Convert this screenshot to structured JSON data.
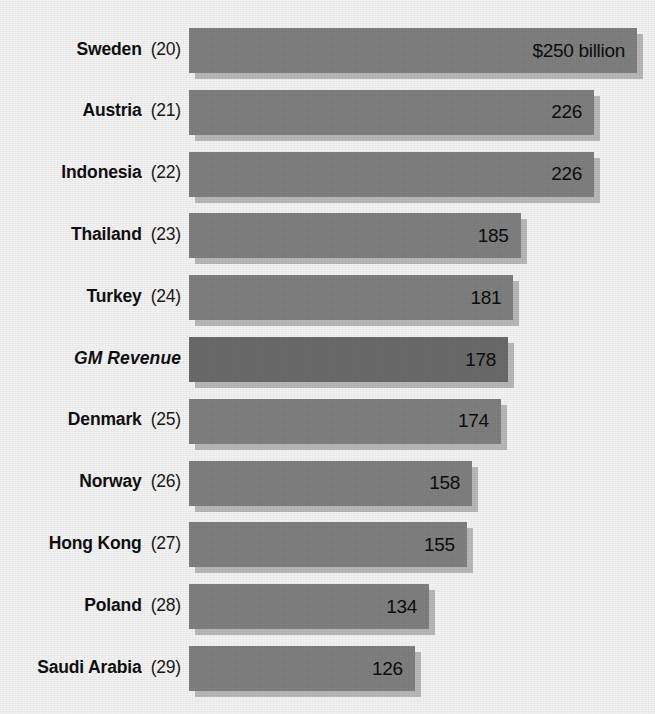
{
  "chart_data": {
    "type": "bar",
    "orientation": "horizontal",
    "title": "",
    "xlabel": "",
    "ylabel": "",
    "unit": "$ billion",
    "xlim": [
      0,
      250
    ],
    "grid": false,
    "legend": false,
    "value_label_position": "inside-end",
    "categories": [
      "Sweden",
      "Austria",
      "Indonesia",
      "Thailand",
      "Turkey",
      "GM Revenue",
      "Denmark",
      "Norway",
      "Hong Kong",
      "Poland",
      "Saudi Arabia"
    ],
    "values": [
      250,
      226,
      226,
      185,
      181,
      178,
      174,
      158,
      155,
      134,
      126
    ],
    "rows": [
      {
        "name": "Sweden",
        "rank": "(20)",
        "value": 250,
        "value_label": "$250 billion",
        "highlight": false,
        "italic": false
      },
      {
        "name": "Austria",
        "rank": "(21)",
        "value": 226,
        "value_label": "226",
        "highlight": false,
        "italic": false
      },
      {
        "name": "Indonesia",
        "rank": "(22)",
        "value": 226,
        "value_label": "226",
        "highlight": false,
        "italic": false
      },
      {
        "name": "Thailand",
        "rank": "(23)",
        "value": 185,
        "value_label": "185",
        "highlight": false,
        "italic": false
      },
      {
        "name": "Turkey",
        "rank": "(24)",
        "value": 181,
        "value_label": "181",
        "highlight": false,
        "italic": false
      },
      {
        "name": "GM Revenue",
        "rank": "",
        "value": 178,
        "value_label": "178",
        "highlight": true,
        "italic": true
      },
      {
        "name": "Denmark",
        "rank": "(25)",
        "value": 174,
        "value_label": "174",
        "highlight": false,
        "italic": false
      },
      {
        "name": "Norway",
        "rank": "(26)",
        "value": 158,
        "value_label": "158",
        "highlight": false,
        "italic": false
      },
      {
        "name": "Hong Kong",
        "rank": "(27)",
        "value": 155,
        "value_label": "155",
        "highlight": false,
        "italic": false
      },
      {
        "name": "Poland",
        "rank": "(28)",
        "value": 134,
        "value_label": "134",
        "highlight": false,
        "italic": false
      },
      {
        "name": "Saudi Arabia",
        "rank": "(29)",
        "value": 126,
        "value_label": "126",
        "highlight": false,
        "italic": false
      }
    ],
    "clipped_top_row": {
      "name": "",
      "rank": "(19)",
      "value_label": ""
    },
    "colors": {
      "background": "#f4f4f4",
      "bar": "#808080",
      "bar_highlight": "#6b6b6b",
      "bar_shadow": "#b9b9b9",
      "text": "#101010"
    },
    "geometry": {
      "bar_origin_x": 189,
      "px_per_unit": 1.792,
      "row_pitch": 61.8,
      "first_row_top": 25,
      "bar_height": 45
    }
  }
}
